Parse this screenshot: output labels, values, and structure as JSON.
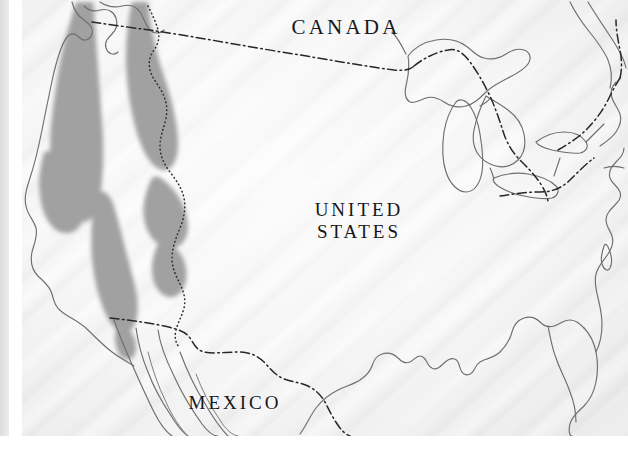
{
  "map": {
    "title": "Range map of the western United States",
    "labels": [
      {
        "id": "canada",
        "text": "CANADA"
      },
      {
        "id": "united_states",
        "text": "UNITED\nSTATES"
      },
      {
        "id": "mexico",
        "text": "MEXICO"
      }
    ],
    "colors": {
      "paper": "#f3f3f3",
      "page_edge": "#dcdcdc",
      "coastline": "#6b6b6b",
      "range_shading": "#9a9a9a",
      "border_line": "#2b2b2b",
      "label_text": "#17171a",
      "margin": "#ffffff"
    },
    "legend_semantics": {
      "range_shading": "Shaded gray area indicates species distribution range",
      "dash_dot_line": "International boundary",
      "dotted_line": "State boundary",
      "solid_thin_line": "Coastline / shoreline"
    },
    "features": {
      "coastlines": [
        "pacific-coast",
        "gulf-coast",
        "atlantic-coast",
        "great-lakes",
        "baja-california",
        "florida-peninsula"
      ],
      "international_borders": [
        "usa-canada-49th-parallel",
        "usa-canada-great-lakes",
        "usa-mexico-rio-grande"
      ],
      "state_borders": [
        "cascade-sierra-interior-line"
      ],
      "range_polygons": [
        "coast-cascade-range",
        "sierra-nevada-range",
        "northern-rockies-range",
        "central-rockies-range",
        "southern-rockies-range"
      ]
    }
  }
}
